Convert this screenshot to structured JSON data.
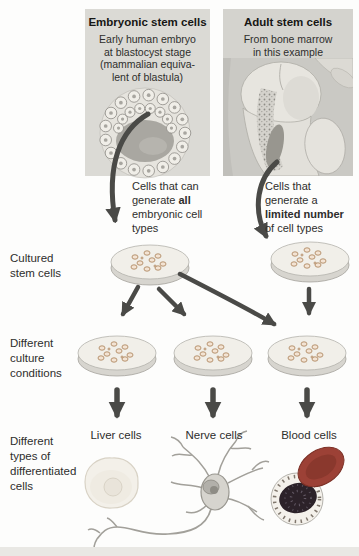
{
  "panels": {
    "embryonic": {
      "title": "Embryonic stem cells",
      "description": "Early human embryo\nat blastocyst stage\n(mammalian equiva-\nlent of blastula)",
      "capability_line1": "Cells that can",
      "capability_line2_pre": "generate ",
      "capability_line2_bold": "all",
      "capability_line3": "embryonic cell",
      "capability_line4": "types"
    },
    "adult": {
      "title": "Adult stem cells",
      "description": "From bone marrow\nin this example",
      "capability_line1": "Cells that",
      "capability_line2": "generate a",
      "capability_line3_bold": "limited number",
      "capability_line4": "of cell types"
    }
  },
  "row_labels": {
    "cultured": "Cultured\nstem cells",
    "culture_conditions": "Different\nculture\nconditions",
    "differentiated": "Different\ntypes of\ndifferentiated\ncells"
  },
  "differentiated_cells": [
    {
      "label": "Liver cells"
    },
    {
      "label": "Nerve cells"
    },
    {
      "label": "Blood cells"
    }
  ],
  "colors": {
    "panel_bg": "#dbdad5",
    "panel_bg_adult": "#d4d3ce",
    "arrow": "#4a4a47",
    "text": "#2e2e2c",
    "red_blood_cell": "#9c4136",
    "white_cell_nucleus": "#2c2229"
  }
}
